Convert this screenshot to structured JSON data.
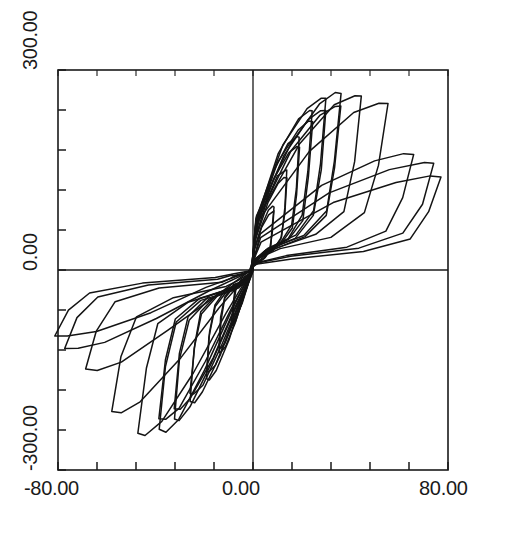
{
  "chart_data": {
    "type": "line",
    "title": "",
    "subtitle": "",
    "xlabel": "",
    "ylabel": "",
    "xlim": [
      -80.0,
      80.0
    ],
    "ylim": [
      -300.0,
      300.0
    ],
    "x_tick_labels": [
      "-80.00",
      "0.00",
      "80.00"
    ],
    "y_tick_labels": [
      "-300.00",
      "0.00",
      "300.00"
    ],
    "x_tick_values": [
      -80.0,
      0.0,
      80.0
    ],
    "y_tick_values": [
      -300.0,
      0.0,
      300.0
    ],
    "x_minor_tick_count": 5,
    "y_minor_tick_count": 5,
    "grid": false,
    "legend": "none",
    "zero_axes": true,
    "line_color": "#141414",
    "background_color": "#ffffff",
    "axis_color": "#1a1a1a",
    "series": [
      {
        "name": "cycle-1",
        "peak_x": 8.0,
        "peak_y": 95.0,
        "min_x": -8.0,
        "min_y": -82.0,
        "repeats": 2
      },
      {
        "name": "cycle-2",
        "peak_x": 13.0,
        "peak_y": 150.0,
        "min_x": -13.0,
        "min_y": -125.0,
        "repeats": 2
      },
      {
        "name": "cycle-3",
        "peak_x": 18.0,
        "peak_y": 200.0,
        "min_x": -18.0,
        "min_y": -165.0,
        "repeats": 2
      },
      {
        "name": "cycle-4",
        "peak_x": 23.0,
        "peak_y": 240.0,
        "min_x": -24.0,
        "min_y": -200.0,
        "repeats": 2
      },
      {
        "name": "cycle-5",
        "peak_x": 28.0,
        "peak_y": 258.0,
        "min_x": -30.0,
        "min_y": -225.0,
        "repeats": 2
      },
      {
        "name": "cycle-6",
        "peak_x": 34.0,
        "peak_y": 265.0,
        "min_x": -36.0,
        "min_y": -242.0,
        "repeats": 2
      },
      {
        "name": "cycle-7",
        "peak_x": 42.0,
        "peak_y": 262.0,
        "min_x": -44.0,
        "min_y": -248.0,
        "repeats": 1
      },
      {
        "name": "cycle-8",
        "peak_x": 52.0,
        "peak_y": 250.0,
        "min_x": -54.0,
        "min_y": -215.0,
        "repeats": 1
      },
      {
        "name": "cycle-9",
        "peak_x": 62.0,
        "peak_y": 175.0,
        "min_x": -64.0,
        "min_y": -150.0,
        "repeats": 1
      },
      {
        "name": "cycle-10",
        "peak_x": 70.0,
        "peak_y": 160.0,
        "min_x": -72.0,
        "min_y": -118.0,
        "repeats": 1
      },
      {
        "name": "cycle-11",
        "peak_x": 73.0,
        "peak_y": 140.0,
        "min_x": -76.0,
        "min_y": -100.0,
        "repeats": 1
      }
    ]
  },
  "axes": {
    "y_top_label": "300.00",
    "y_zero_label": "0.00",
    "y_bottom_label": "-300.00",
    "x_left_label": "-80.00",
    "x_zero_label": "0.00",
    "x_right_label": "80.00"
  }
}
